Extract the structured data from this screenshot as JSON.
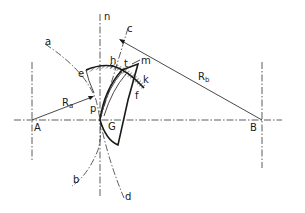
{
  "diagram": {
    "type": "gear-pitch-geometry",
    "labels": {
      "n": "n",
      "c": "c",
      "a": "a",
      "e": "e",
      "h": "h",
      "t": "t",
      "m": "m",
      "k": "k",
      "f": "f",
      "Ra": "R",
      "Ra_sub": "a",
      "Rb": "R",
      "Rb_sub": "b",
      "A": "A",
      "B": "B",
      "p": "p",
      "G": "G",
      "b": "b",
      "d": "d"
    },
    "points": {
      "A": [
        32,
        120
      ],
      "B": [
        262,
        120
      ],
      "p": [
        100,
        120
      ]
    },
    "colors": {
      "line": "#1a1a1a",
      "background": "#ffffff"
    }
  }
}
